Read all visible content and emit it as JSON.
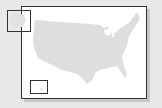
{
  "map": {
    "title": "",
    "subject": "United States outline",
    "fill_color": "#dedede",
    "background_color": "#ffffff",
    "frame_color": "#333333",
    "insets": [
      {
        "name": "Alaska",
        "position": "top-left"
      },
      {
        "name": "Hawaii",
        "position": "bottom-left"
      }
    ]
  }
}
